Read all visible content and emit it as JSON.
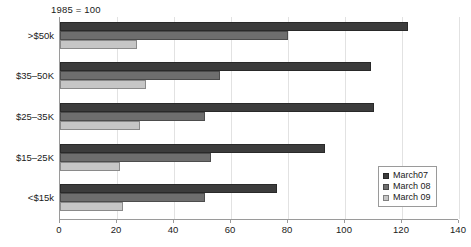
{
  "chart_data": {
    "type": "bar",
    "orientation": "horizontal",
    "title": "1985 = 100",
    "xlabel": "",
    "ylabel": "",
    "xlim": [
      0,
      140
    ],
    "xticks": [
      0,
      20,
      40,
      60,
      80,
      100,
      120,
      140
    ],
    "grid": true,
    "legend_position": "lower-right",
    "categories": [
      ">$50k",
      "$35–50K",
      "$25–35K",
      "$15–25K",
      "<$15k"
    ],
    "series": [
      {
        "name": "March07",
        "color": "#3c3c3c",
        "values": [
          122,
          109,
          110,
          93,
          76
        ]
      },
      {
        "name": "March 08",
        "color": "#6e6e6e",
        "values": [
          80,
          56,
          51,
          53,
          51
        ]
      },
      {
        "name": "March 09",
        "color": "#c6c6c6",
        "values": [
          27,
          30,
          28,
          21,
          22
        ]
      }
    ]
  }
}
